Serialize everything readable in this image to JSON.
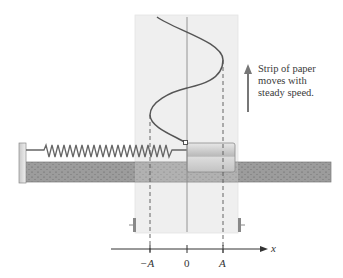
{
  "diagram": {
    "caption_lines": [
      "Strip of paper",
      "moves with",
      "steady speed."
    ],
    "axis": {
      "variable": "x",
      "ticks": [
        {
          "label": "−A",
          "x": 150
        },
        {
          "label": "0",
          "x": 187
        },
        {
          "label": "A",
          "x": 223
        }
      ]
    },
    "components": [
      "spring",
      "mass-block",
      "track",
      "paper-strip",
      "sine-trace",
      "arrow-up"
    ],
    "colors": {
      "paper": "#f0f0f0",
      "track": "#9a9a9a",
      "spring": "#6e6e6e",
      "curve": "#5a5a5a",
      "arrow": "#7a7a7a"
    }
  }
}
